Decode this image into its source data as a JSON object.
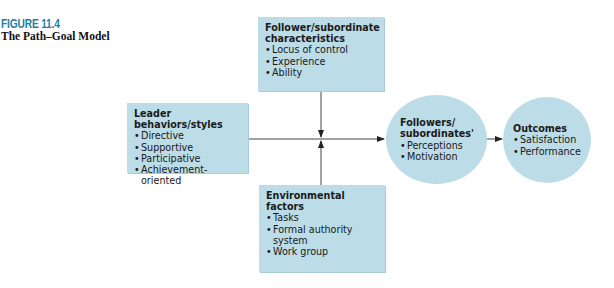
{
  "figure": {
    "label": "FIGURE 11.4",
    "title": "The Path–Goal Model",
    "label_color": "#1d7fa3",
    "box_color": "#bcdce7"
  },
  "nodes": {
    "follower_characteristics": {
      "heading_line1": "Follower/subordinate",
      "heading_line2": "characteristics",
      "items": [
        "Locus of control",
        "Experience",
        "Ability"
      ]
    },
    "leader_behaviors": {
      "heading": "Leader behaviors/styles",
      "items": [
        "Directive",
        "Supportive",
        "Participative",
        "Achievement-oriented"
      ]
    },
    "environmental_factors": {
      "heading": "Environmental factors",
      "items": [
        "Tasks",
        "Formal authority system",
        "Work group"
      ]
    },
    "followers_perceptions": {
      "heading_line1": "Followers/",
      "heading_line2": "subordinates'",
      "items": [
        "Perceptions",
        "Motivation"
      ]
    },
    "outcomes": {
      "heading": "Outcomes",
      "items": [
        "Satisfaction",
        "Performance"
      ]
    }
  },
  "edges": [
    {
      "from": "leader_behaviors",
      "to": "followers_perceptions",
      "type": "arrow"
    },
    {
      "from": "follower_characteristics",
      "to": "leader_followers_link",
      "type": "moderator-arrow"
    },
    {
      "from": "environmental_factors",
      "to": "leader_followers_link",
      "type": "moderator-arrow"
    },
    {
      "from": "followers_perceptions",
      "to": "outcomes",
      "type": "arrow"
    }
  ]
}
